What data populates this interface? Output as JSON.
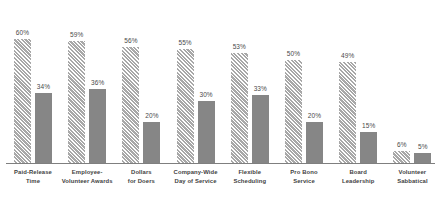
{
  "chart_data": {
    "type": "bar",
    "title": "",
    "subtitle": "",
    "xlabel": "",
    "ylabel": "",
    "ylim": [
      0,
      72
    ],
    "grid": false,
    "legend": "none",
    "axis": {
      "baseline_visible": true,
      "y_axis_visible": false,
      "x_tick_labels_visible": true
    },
    "value_label_suffix": "%",
    "categories": [
      "Paid-Release Time",
      "Employee-Volunteer Awards",
      "Dollars for Doers",
      "Company-Wide Day of Service",
      "Flexible Scheduling",
      "Pro Bono Service",
      "Board Leadership",
      "Volunteer Sabbatical"
    ],
    "category_lines": [
      [
        "Paid-Release",
        "Time"
      ],
      [
        "Employee-",
        "Volunteer Awards"
      ],
      [
        "Dollars",
        "for Doers"
      ],
      [
        "Company-Wide",
        "Day of Service"
      ],
      [
        "Flexible",
        "Scheduling"
      ],
      [
        "Pro Bono",
        "Service"
      ],
      [
        "Board",
        "Leadership"
      ],
      [
        "Volunteer",
        "Sabbatical"
      ]
    ],
    "series": [
      {
        "name": "Series 1",
        "style": "hatched",
        "color": "#c9c9c9",
        "values": [
          60,
          59,
          56,
          55,
          53,
          50,
          49,
          6
        ],
        "labels": [
          "60%",
          "59%",
          "56%",
          "55%",
          "53%",
          "50%",
          "49%",
          "6%"
        ]
      },
      {
        "name": "Series 2",
        "style": "solid",
        "color": "#868686",
        "values": [
          34,
          36,
          20,
          30,
          33,
          20,
          15,
          5
        ],
        "labels": [
          "34%",
          "36%",
          "20%",
          "30%",
          "33%",
          "20%",
          "15%",
          "5%"
        ]
      }
    ]
  },
  "colors": {
    "series1": "#c9c9c9",
    "series1_hatch": "#a8a8a8",
    "series2": "#868686",
    "axis": "#7f7f7f",
    "value_text": "#4a4a4a",
    "category_text": "#3f3f3f",
    "background": "#ffffff"
  }
}
